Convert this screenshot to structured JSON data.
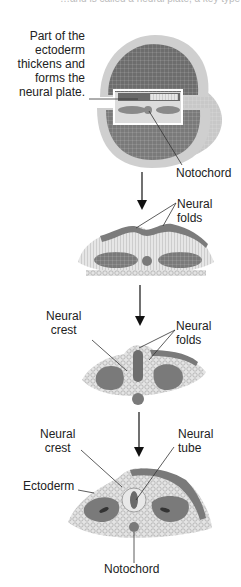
{
  "diagram": {
    "top_caption_fragment": "…and is called a neural plate, a key type of neural tissue.",
    "stages": [
      {
        "id": "stage-1",
        "name": "Neural plate embryo",
        "labels": {
          "neural_plate_desc": "Part of the\nectoderm\nthickens and\nforms the\nneural plate.",
          "notochord": "Notochord"
        }
      },
      {
        "id": "stage-2",
        "name": "Neural folds forming",
        "labels": {
          "neural_folds": "Neural\nfolds"
        }
      },
      {
        "id": "stage-3",
        "name": "Neural folds closing",
        "labels": {
          "neural_crest": "Neural\ncrest",
          "neural_folds": "Neural\nfolds"
        }
      },
      {
        "id": "stage-4",
        "name": "Neural tube formed",
        "labels": {
          "neural_crest": "Neural\ncrest",
          "neural_tube": "Neural\ntube",
          "ectoderm": "Ectoderm",
          "notochord": "Notochord"
        }
      }
    ],
    "colors": {
      "background": "#ffffff",
      "dark_tissue": "#6e6e6e",
      "mid_tissue": "#9a9a9a",
      "light_tissue": "#d6d6d6",
      "text": "#222222",
      "leader_line": "#333333",
      "highlight_box": "#ffffff"
    }
  }
}
